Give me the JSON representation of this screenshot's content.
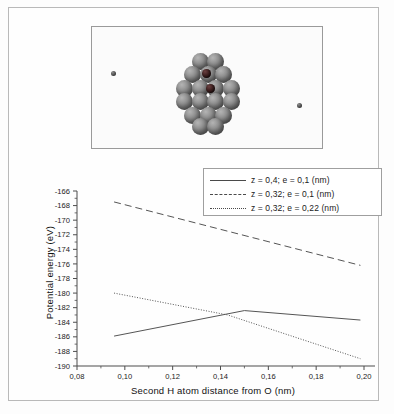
{
  "figure": {
    "molecule_panel": {
      "description": "ball-and-stick cluster of gray atoms with two dark central atoms",
      "free_atom_left": "H atom",
      "free_atom_right": "H atom",
      "central_atoms": [
        "O atom",
        "H atom"
      ]
    }
  },
  "chart_data": {
    "type": "line",
    "title": "",
    "xlabel": "Second H atom distance from O (nm)",
    "ylabel": "Potential energy (eV)",
    "xlim": [
      0.08,
      0.206
    ],
    "ylim": [
      -190,
      -166
    ],
    "xticks": [
      "0,08",
      "0,10",
      "0,12",
      "0,14",
      "0,16",
      "0,18",
      "0,20"
    ],
    "xtick_values": [
      0.08,
      0.1,
      0.12,
      0.14,
      0.16,
      0.18,
      0.2
    ],
    "yticks": [
      "-166",
      "-168",
      "-170",
      "-172",
      "-174",
      "-176",
      "-178",
      "-180",
      "-182",
      "-184",
      "-186",
      "-188",
      "-190"
    ],
    "ytick_values": [
      -166,
      -168,
      -170,
      -172,
      -174,
      -176,
      -178,
      -180,
      -182,
      -184,
      -186,
      -188,
      -190
    ],
    "grid": false,
    "legend_position": "top-right",
    "series": [
      {
        "name": "z = 0,4; e = 0,1 (nm)",
        "style": "solid",
        "x": [
          0.0955,
          0.15,
          0.1985
        ],
        "y": [
          -185.9,
          -182.4,
          -183.7
        ]
      },
      {
        "name": "z = 0,32; e = 0,1 (nm)",
        "style": "dashed",
        "x": [
          0.0955,
          0.1985
        ],
        "y": [
          -167.5,
          -176.2
        ]
      },
      {
        "name": "z = 0,32; e = 0,22 (nm)",
        "style": "dotted",
        "x": [
          0.0955,
          0.143,
          0.1985
        ],
        "y": [
          -180.0,
          -183.0,
          -189.0
        ]
      }
    ]
  },
  "legend": {
    "items": [
      {
        "label": "z = 0,4; e = 0,1 (nm)",
        "style": "solid"
      },
      {
        "label": "z = 0,32; e = 0,1 (nm)",
        "style": "dashed"
      },
      {
        "label": "z = 0,32; e = 0,22 (nm)",
        "style": "dotted"
      }
    ]
  }
}
